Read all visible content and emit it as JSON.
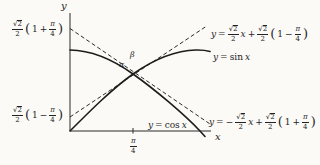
{
  "figure": {
    "type": "math-plot",
    "functions_shown": [
      "y = sin x",
      "y = cos x"
    ],
    "tangency_x": "π/4",
    "colors": {
      "ink": "#222222",
      "background": "#fbfaf7"
    }
  },
  "sym": {
    "y": "y",
    "x": "x",
    "eq": "=",
    "plus": "+",
    "minus": "−",
    "one": "1",
    "sqrt": "√",
    "two": "2",
    "pi": "π",
    "four": "4",
    "lp": "(",
    "rp": ")",
    "alpha": "α",
    "beta": "β",
    "sin_word": "sin",
    "cos_word": "cos"
  }
}
